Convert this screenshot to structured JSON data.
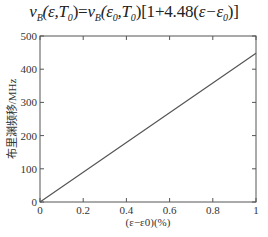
{
  "formula": "ν_B(ε,T₀) = ν_B(ε₀,T₀)[1 + 4.48(ε − ε₀)]",
  "formula_display": "νB(ε,T0)=νB(ε0,T0)[1+4.48(ε−ε0)]",
  "chart_data": {
    "type": "line",
    "title": "νB(ε,T0)=νB(ε0,T0)[1+4.48(ε−ε0)]",
    "xlabel": "(ε−ε0)(%)",
    "ylabel": "布里渊频移/MHz",
    "x": [
      0,
      0.2,
      0.4,
      0.6,
      0.8,
      1.0
    ],
    "series": [
      {
        "name": "Brillouin frequency shift",
        "values": [
          0,
          89.6,
          179.2,
          268.8,
          358.4,
          448
        ]
      }
    ],
    "xlim": [
      0,
      1
    ],
    "ylim": [
      0,
      500
    ],
    "xticks": [
      "0",
      "0.2",
      "0.4",
      "0.6",
      "0.8",
      "1"
    ],
    "yticks": [
      "0",
      "100",
      "200",
      "300",
      "400",
      "500"
    ],
    "grid": false,
    "legend": "none",
    "line_color": "#555555"
  }
}
